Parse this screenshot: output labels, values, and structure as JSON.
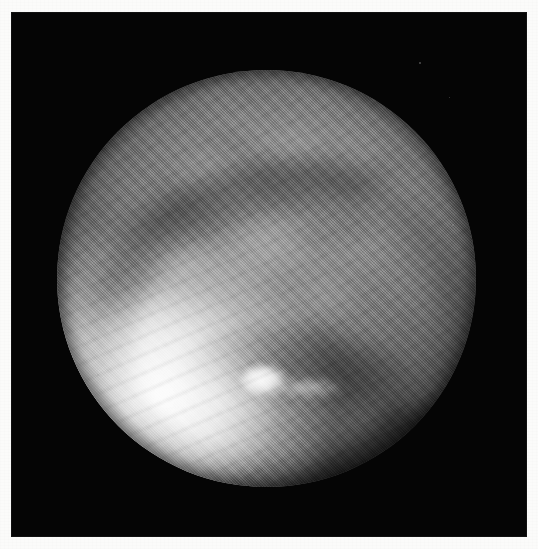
{
  "page": {
    "kind": "scanned-photographic-plate",
    "width_px": 538,
    "height_px": 549,
    "caption": "",
    "paper_color": "#fbfbfa",
    "plate_color": "#050505"
  },
  "plate": {
    "left_px": 11,
    "top_px": 12,
    "width_px": 516,
    "height_px": 525,
    "background_label": "black field"
  },
  "subject": {
    "name": "illuminated-spherical-body",
    "description": "Grayscale halftone photograph of a near-full spherical body filling a circular frame",
    "center_x_px": 266,
    "center_y_px": 278,
    "diameter_px": 419,
    "tone_range": {
      "darkest": "#070707",
      "shadow": "#2a2a2a",
      "midtone": "#8b8b8b",
      "highlight": "#e8e8e8",
      "brightest": "#f4f4f4"
    }
  },
  "features": [
    {
      "id": "bright-limb",
      "label": "bright south-west limb",
      "position": "lower-left",
      "tone": "#ededed"
    },
    {
      "id": "dark-arc",
      "label": "dark crescent band",
      "position": "upper-left sweeping to bottom-centre",
      "tone": "#101010"
    },
    {
      "id": "lower-band",
      "label": "lower dark band",
      "position": "bottom-centre to right",
      "tone": "#3c3c3c"
    },
    {
      "id": "bright-blob",
      "label": "bright knot",
      "position_x_px": 248,
      "position_y_px": 368,
      "tone": "#f2f2f2"
    },
    {
      "id": "mottling",
      "label": "diffuse cloud mottling",
      "position": "northern hemisphere",
      "tone": "#979797"
    },
    {
      "id": "halftone-screen",
      "label": "diagonal halftone print screen",
      "position": "across entire disc",
      "tone": "#000000"
    }
  ],
  "artifacts": {
    "specks": [
      {
        "x_px": 419,
        "y_px": 62,
        "size_px": 2
      },
      {
        "x_px": 452,
        "y_px": 224,
        "size_px": 2
      },
      {
        "x_px": 97,
        "y_px": 374,
        "size_px": 2
      },
      {
        "x_px": 449,
        "y_px": 97,
        "size_px": 1
      }
    ]
  }
}
